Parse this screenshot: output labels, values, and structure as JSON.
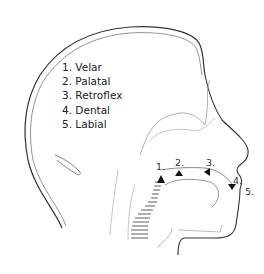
{
  "diagram": {
    "legend": [
      {
        "label": "1. Velar"
      },
      {
        "label": "2. Palatal"
      },
      {
        "label": "3. Retroflex"
      },
      {
        "label": "4. Dental"
      },
      {
        "label": "5. Labial"
      }
    ],
    "markers": [
      {
        "label": "1."
      },
      {
        "label": "2."
      },
      {
        "label": "3."
      },
      {
        "label": "4."
      },
      {
        "label": "5."
      }
    ],
    "colors": {
      "line": "#333333",
      "light_line": "#9a9a9a",
      "marker": "#111111"
    }
  }
}
